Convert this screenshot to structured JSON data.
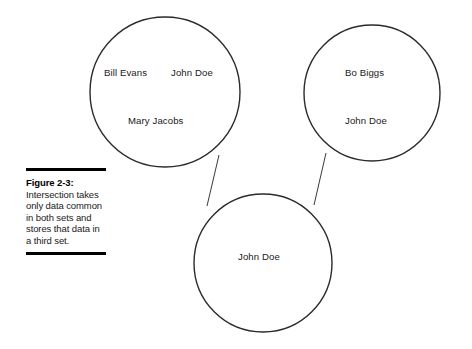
{
  "figure": {
    "caption_label": "Figure 2-3:",
    "caption_body": "Intersection takes only data common in both sets and stores that data in a third set.",
    "colors": {
      "circle_stroke": "#2b2b2b",
      "connector_stroke": "#3a3a3a",
      "text": "#1a1a1a",
      "rule": "#000000",
      "background": "#ffffff"
    }
  },
  "diagram": {
    "type": "venn-set-operation",
    "operation": "intersection",
    "sets": [
      {
        "name": "set-a",
        "position": "top-left",
        "cx": 165,
        "cy": 92,
        "r": 75,
        "members": [
          {
            "label": "Bill Evans",
            "x": 104,
            "y": 67
          },
          {
            "label": "John Doe",
            "x": 171,
            "y": 67
          },
          {
            "label": "Mary Jacobs",
            "x": 128,
            "y": 115
          }
        ]
      },
      {
        "name": "set-b",
        "position": "top-right",
        "cx": 372,
        "cy": 93,
        "r": 68,
        "members": [
          {
            "label": "Bo Biggs",
            "x": 345,
            "y": 67
          },
          {
            "label": "John Doe",
            "x": 345,
            "y": 115
          }
        ]
      },
      {
        "name": "set-result",
        "position": "bottom",
        "cx": 263,
        "cy": 263,
        "r": 69,
        "members": [
          {
            "label": "John Doe",
            "x": 238,
            "y": 251
          }
        ]
      }
    ],
    "connectors": [
      {
        "name": "connector-set-a-to-result",
        "x1": 219,
        "y1": 155,
        "x2": 207,
        "y2": 206
      },
      {
        "name": "connector-set-b-to-result",
        "x1": 326,
        "y1": 153,
        "x2": 314,
        "y2": 205
      }
    ]
  }
}
